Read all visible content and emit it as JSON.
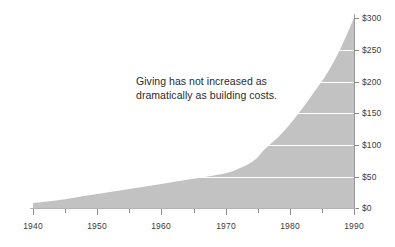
{
  "chart_data": {
    "type": "area",
    "title": "",
    "subtitle": "",
    "xlabel": "",
    "ylabel": "",
    "xlim": [
      1940,
      1990
    ],
    "ylim": [
      0,
      300
    ],
    "grid": true,
    "legend": null,
    "series": [
      {
        "name": "Building costs",
        "color": "#c2c2c2",
        "x": [
          1940,
          1945,
          1950,
          1955,
          1960,
          1965,
          1970,
          1972,
          1974,
          1975,
          1976,
          1978,
          1980,
          1982,
          1984,
          1986,
          1988,
          1990
        ],
        "values": [
          8,
          14,
          22,
          30,
          38,
          46,
          55,
          62,
          72,
          80,
          92,
          110,
          132,
          158,
          186,
          216,
          254,
          300
        ]
      }
    ],
    "annotations": [
      {
        "name": "giving-annotation",
        "lines": [
          "Giving has not increased as",
          "dramatically as building costs."
        ],
        "x": 136,
        "y": 74
      }
    ],
    "y_ticks": [
      {
        "value": 0,
        "label": "$0",
        "y": 208
      },
      {
        "value": 50,
        "label": "$50",
        "y": 177
      },
      {
        "value": 100,
        "label": "$100",
        "y": 145
      },
      {
        "value": 150,
        "label": "$150",
        "y": 113
      },
      {
        "value": 200,
        "label": "$200",
        "y": 82
      },
      {
        "value": 250,
        "label": "$250",
        "y": 50
      },
      {
        "value": 300,
        "label": "$300",
        "y": 18
      }
    ],
    "x_ticks": [
      {
        "value": 1940,
        "label": "1940",
        "x": 33,
        "major": true
      },
      {
        "value": 1945,
        "label": "",
        "x": 65,
        "major": false
      },
      {
        "value": 1950,
        "label": "1950",
        "x": 97,
        "major": true
      },
      {
        "value": 1955,
        "label": "",
        "x": 129,
        "major": false
      },
      {
        "value": 1960,
        "label": "1960",
        "x": 161,
        "major": true
      },
      {
        "value": 1965,
        "label": "",
        "x": 194,
        "major": false
      },
      {
        "value": 1970,
        "label": "1970",
        "x": 226,
        "major": true
      },
      {
        "value": 1975,
        "label": "",
        "x": 258,
        "major": false
      },
      {
        "value": 1980,
        "label": "1980",
        "x": 290,
        "major": true
      },
      {
        "value": 1985,
        "label": "",
        "x": 322,
        "major": false
      },
      {
        "value": 1990,
        "label": "1990",
        "x": 354,
        "major": true
      }
    ],
    "colors": {
      "area_fill": "#c2c2c2",
      "gridline": "#ffffff",
      "axis": "#8c8c8c",
      "text": "#3b3b3b",
      "background": "#ffffff"
    }
  }
}
